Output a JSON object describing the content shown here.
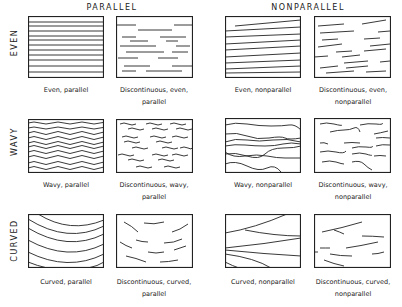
{
  "columns": {
    "parallel": "PARALLEL",
    "nonparallel": "NONPARALLEL"
  },
  "rows": {
    "even": "EVEN",
    "wavy": "WAVY",
    "curved": "CURVED"
  },
  "panels": {
    "even_parallel": {
      "caption": "Even, parallel"
    },
    "disc_even_parallel": {
      "caption_1": "Discontinuous, even,",
      "caption_2": "parallel"
    },
    "even_nonparallel": {
      "caption": "Even, nonparallel"
    },
    "disc_even_nonparallel": {
      "caption_1": "Discontinuous, even,",
      "caption_2": "nonparallel"
    },
    "wavy_parallel": {
      "caption": "Wavy, parallel"
    },
    "disc_wavy_parallel": {
      "caption_1": "Discontinuous, wavy,",
      "caption_2": "parallel"
    },
    "wavy_nonparallel": {
      "caption": "Wavy, nonparallel"
    },
    "disc_wavy_nonparallel": {
      "caption_1": "Discontinuous, wavy,",
      "caption_2": "nonparallel"
    },
    "curved_parallel": {
      "caption": "Curved, parallel"
    },
    "disc_curved_parallel": {
      "caption_1": "Discontinuous, curved,",
      "caption_2": "parallel"
    },
    "curved_nonparallel": {
      "caption": "Curved, nonparallel"
    },
    "disc_curved_nonparallel": {
      "caption_1": "Discontinuous, curved,",
      "caption_2": "nonparallel"
    }
  }
}
